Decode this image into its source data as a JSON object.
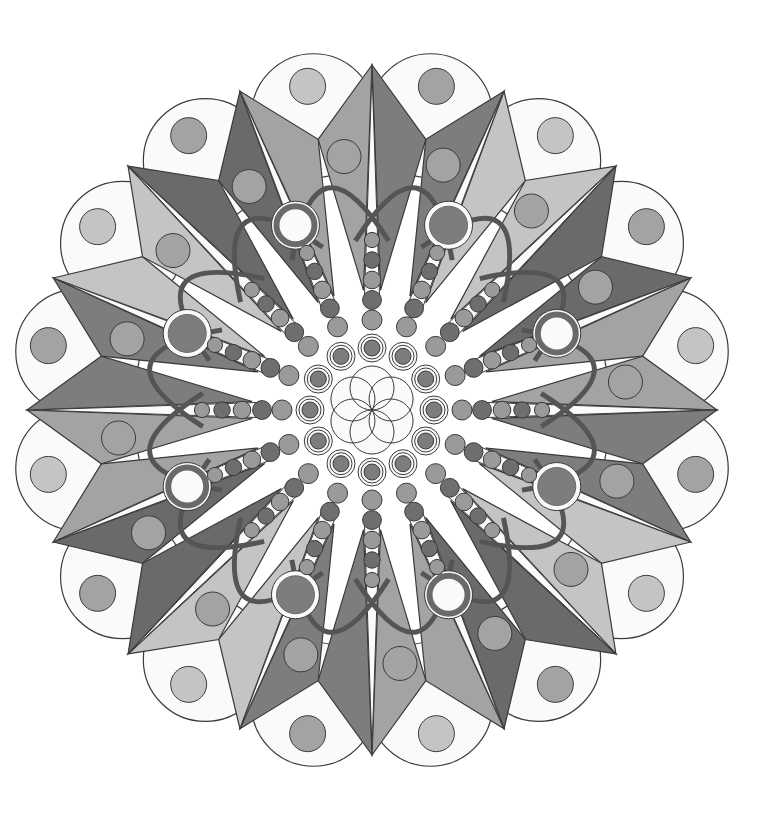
{
  "artwork": {
    "type": "mandala-coloring",
    "medium": "colored pencil (grayscale)",
    "center": [
      372,
      410
    ],
    "symmetry": 16,
    "outer_star_radius": 345,
    "inner_vertex_radius": 300,
    "petal_circle_radius": 300,
    "petal_circle_size": 62,
    "inner_ring_count": 12,
    "inner_ring_radius": 62,
    "bead_rows": 16,
    "arc_count": 16
  },
  "palette": {
    "background": "#ffffff",
    "line": "#3a3a3a",
    "light": "#c4c4c4",
    "mid": "#a3a3a3",
    "dark": "#7d7d7d",
    "darker": "#6a6a6a",
    "arc": "#555555",
    "bead_light": "#9a9a9a",
    "bead_dark": "#6e6e6e",
    "white": "#fafafa"
  }
}
